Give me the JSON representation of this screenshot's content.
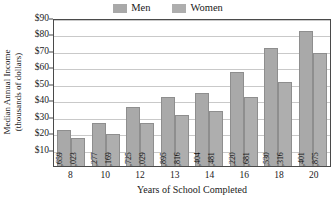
{
  "chart_data": {
    "type": "bar",
    "title": "",
    "xlabel": "Years of School Completed",
    "ylabel": "Median Annual Income (thousands of dollars)",
    "ylabel_line1": "Median Annual Income",
    "ylabel_line2": "(thousands of dollars)",
    "categories": [
      "8",
      "10",
      "12",
      "13",
      "14",
      "16",
      "18",
      "20"
    ],
    "ylim": [
      0,
      90
    ],
    "ytick_labels": [
      "$90",
      "$80",
      "$70",
      "$60",
      "$50",
      "$40",
      "$30",
      "$20",
      "$10"
    ],
    "ytick_values": [
      90,
      80,
      70,
      60,
      50,
      40,
      30,
      20,
      10
    ],
    "grid": true,
    "legend_position": "top-center",
    "series": [
      {
        "name": "Men",
        "color": "#a9a9a9",
        "values": [
          21659,
          26277,
          35725,
          41895,
          44404,
          57220,
          71530,
          82401
        ],
        "labels": [
          "21,659",
          "26,277",
          "35,725",
          "41,895",
          "44,404",
          "57,220",
          "71,530",
          "82,401"
        ]
      },
      {
        "name": "Women",
        "color": "#aeaeae",
        "values": [
          17023,
          19169,
          26029,
          30816,
          33481,
          41681,
          51316,
          68875
        ],
        "labels": [
          "17,023",
          "19,169",
          "26,029",
          "30,816",
          "33,481",
          "41,681",
          "51,316",
          "68,875"
        ]
      }
    ]
  },
  "legend": {
    "items": [
      {
        "label": "Men",
        "color": "#a9a9a9",
        "swatch_name": "men-swatch"
      },
      {
        "label": "Women",
        "color": "#aeaeae",
        "swatch_name": "women-swatch"
      }
    ]
  }
}
